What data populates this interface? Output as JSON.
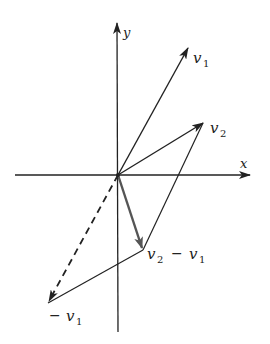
{
  "diagram": {
    "colors": {
      "line": "#222222",
      "highlight": "#555555",
      "background": "#ffffff"
    },
    "axes": {
      "x_label": "x",
      "y_label": "y"
    },
    "vectors": [
      {
        "id": "v1",
        "label": "v",
        "subscript": "1",
        "from": "origin",
        "to": "v1_tip",
        "style": "solid-arrow"
      },
      {
        "id": "v2",
        "label": "v",
        "subscript": "2",
        "from": "origin",
        "to": "v2_tip",
        "style": "solid-arrow"
      },
      {
        "id": "v2_minus_v1",
        "label": "v",
        "subscript": "2",
        "suffix": "− v",
        "suffix_subscript": "1",
        "from": "origin",
        "to": "diff_tip",
        "style": "thick-gray-arrow"
      },
      {
        "id": "neg_v1",
        "label": "− v",
        "subscript": "1",
        "from": "origin",
        "to": "neg_v1_tip",
        "style": "dashed-arrow"
      }
    ],
    "parallelogram_edges": [
      {
        "from": "v2_tip",
        "to": "diff_tip"
      },
      {
        "from": "diff_tip",
        "to": "neg_v1_tip"
      }
    ],
    "labels": {
      "y": "y",
      "x": "x",
      "v1_main": "v",
      "v1_sub": "1",
      "v2_main": "v",
      "v2_sub": "2",
      "diff_main_a": "v",
      "diff_sub_a": "2",
      "diff_minus": "−",
      "diff_main_b": "v",
      "diff_sub_b": "1",
      "neg_minus": "−",
      "neg_main": "v",
      "neg_sub": "1"
    }
  }
}
